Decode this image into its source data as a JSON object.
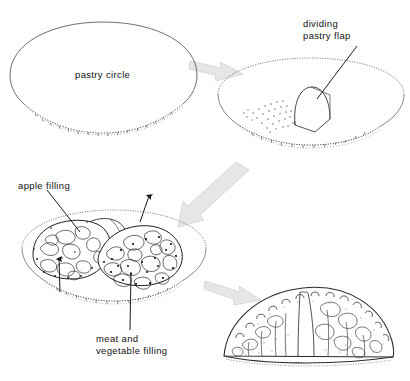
{
  "figure": {
    "background_color": "#ffffff",
    "ink_color": "#111111",
    "arrow_color": "#e2e2e2",
    "arrow_edge_color": "#cfcfcf",
    "stipple_color": "#555555"
  },
  "labels": {
    "pastry_circle": "pastry circle",
    "dividing_flap_line1": "dividing",
    "dividing_flap_line2": "pastry flap",
    "apple_filling": "apple filling",
    "meat_filling_line1": "meat and",
    "meat_filling_line2": "vegetable filling"
  },
  "stages": [
    {
      "id": "stage-1",
      "name": "pastry-circle",
      "label": "pastry circle",
      "description": "Plain rolled pastry oval seen in perspective, crimped lower edge"
    },
    {
      "id": "stage-2",
      "name": "dividing-pastry-flap",
      "label": "dividing pastry flap",
      "description": "Pastry oval with a central arched flap raised upright, stippled area at left"
    },
    {
      "id": "stage-3",
      "name": "filled-pastry",
      "label": "apple filling / meat and vegetable filling",
      "description": "Pastry oval with apple filling mounded left of the flap and meat and vegetable filling mounded right"
    },
    {
      "id": "stage-4",
      "name": "finished-pasty",
      "label": "",
      "description": "Finished sealed pasty with crimped ridge along the top"
    }
  ],
  "arrows": [
    {
      "name": "arrow-stage1-to-stage2",
      "from": "stage-1",
      "to": "stage-2",
      "direction": "right-down"
    },
    {
      "name": "arrow-stage2-to-stage3",
      "from": "stage-2",
      "to": "stage-3",
      "direction": "left-down"
    },
    {
      "name": "arrow-stage3-to-stage4",
      "from": "stage-3",
      "to": "stage-4",
      "direction": "right-down"
    }
  ],
  "leader_lines": [
    {
      "name": "leader-dividing-flap",
      "target": "stage-2"
    },
    {
      "name": "leader-apple-filling",
      "target": "stage-3"
    },
    {
      "name": "leader-meat-filling",
      "target": "stage-3"
    }
  ],
  "pointer_arrows": [
    {
      "name": "pointer-apple-filling-up",
      "target": "stage-3"
    },
    {
      "name": "pointer-fold-direction-up",
      "target": "stage-3"
    }
  ]
}
